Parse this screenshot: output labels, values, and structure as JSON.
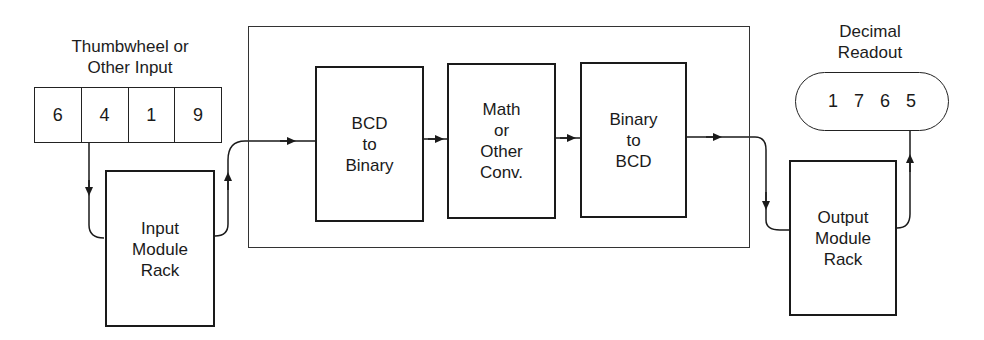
{
  "diagram": {
    "input_device": {
      "title_lines": [
        "Thumbwheel or",
        "Other Input"
      ],
      "digits": [
        "6",
        "4",
        "1",
        "9"
      ]
    },
    "input_module": {
      "label_lines": [
        "Input",
        "Module",
        "Rack"
      ]
    },
    "processor": {
      "blocks": [
        {
          "label_lines": [
            "BCD",
            "to",
            "Binary"
          ]
        },
        {
          "label_lines": [
            "Math",
            "or",
            "Other",
            "Conv."
          ]
        },
        {
          "label_lines": [
            "Binary",
            "to",
            "BCD"
          ]
        }
      ]
    },
    "output_module": {
      "label_lines": [
        "Output",
        "Module",
        "Rack"
      ]
    },
    "output_device": {
      "title_lines": [
        "Decimal",
        "Readout"
      ],
      "digits": [
        "1",
        "7",
        "6",
        "5"
      ]
    },
    "colors": {
      "line": "#1a1a1a",
      "background": "#ffffff"
    }
  }
}
